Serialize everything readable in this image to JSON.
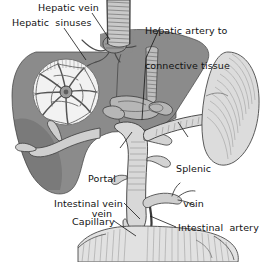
{
  "figure": {
    "background_color": "#ffffff",
    "ink_color": "#121212"
  },
  "labels": {
    "hepatic_vein": "Hepatic vein",
    "hepatic_sinuses": "Hepatic  sinuses",
    "hepatic_artery_line1": "Hepatic artery to",
    "hepatic_artery_line2": "connective tissue",
    "portal_vein_line1": "Portal",
    "portal_vein_line2": "vein",
    "splenic_vein_line1": "Splenic",
    "splenic_vein_line2": "vein",
    "intestinal_vein": "Intestinal vein",
    "capillary": "Capillary",
    "intestinal_artery": "Intestinal  artery"
  },
  "organs": {
    "liver": {
      "name": "liver",
      "fill_color": "#8b8b8b",
      "stroke_color": "#4a4a4a"
    },
    "spleen": {
      "name": "spleen",
      "fill_color": "#dcdcdc",
      "stroke_color": "#5a5a5a"
    },
    "intestine": {
      "name": "intestine",
      "fill_color": "#e2e2e2",
      "stroke_color": "#4f4f4f"
    },
    "sinusoid_inset": {
      "name": "hepatic-sinusoid-magnification",
      "fill_color": "#f2f2f2",
      "stroke_color": "#6d6d6d",
      "center_x": 66,
      "center_y": 92,
      "radius": 33
    }
  },
  "vessels": {
    "vena_cava": {
      "name": "inferior-vena-cava",
      "fill_color": "#c9c9c9"
    },
    "hepatic_vein": {
      "name": "hepatic-vein",
      "fill_color": "#9a9a9a"
    },
    "hepatic_artery": {
      "name": "hepatic-artery",
      "fill_color": "#bdbdbd"
    },
    "portal_vein": {
      "name": "portal-vein",
      "fill_color": "#d8d8d8"
    },
    "splenic_vein": {
      "name": "splenic-vein",
      "fill_color": "#d8d8d8"
    },
    "intestinal_vein": {
      "name": "intestinal-vein",
      "fill_color": "#d8d8d8"
    },
    "intestinal_artery": {
      "name": "intestinal-artery",
      "fill_color": "#cfcfcf"
    },
    "capillary_bed": {
      "name": "capillary-bed",
      "fill_color": "#c5c5c5"
    }
  }
}
